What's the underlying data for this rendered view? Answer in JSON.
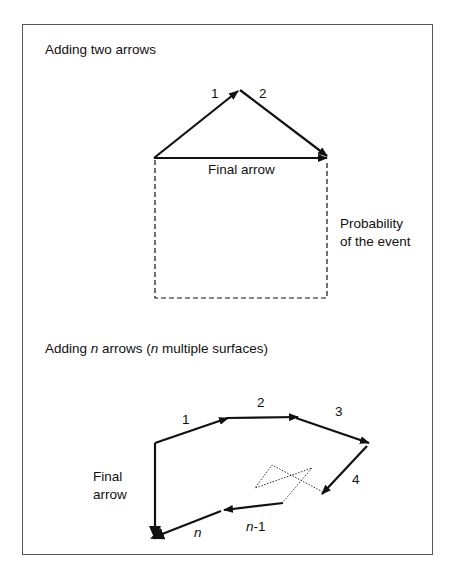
{
  "top_diagram": {
    "title": "Adding two arrows",
    "arrow_labels": [
      "1",
      "2"
    ],
    "final_arrow_label": "Final arrow",
    "probability_label_line1": "Probability",
    "probability_label_line2": "of the event"
  },
  "bottom_diagram": {
    "title_prefix": "Adding ",
    "title_n1": "n",
    "title_middle": " arrows (",
    "title_n2": "n",
    "title_suffix": " multiple surfaces)",
    "arrow_labels": [
      "1",
      "2",
      "3",
      "4"
    ],
    "arrow_n_minus_1_italic": "n",
    "arrow_n_minus_1_suffix": "-1",
    "arrow_n_label": "n",
    "final_arrow_line1": "Final",
    "final_arrow_line2": "arrow"
  },
  "colors": {
    "stroke": "#111111",
    "frame": "#555555",
    "background": "#ffffff"
  }
}
